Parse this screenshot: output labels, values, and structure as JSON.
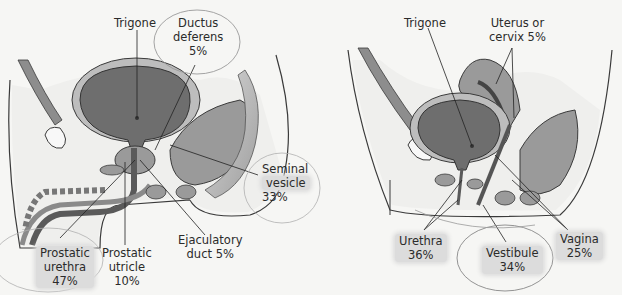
{
  "figure": {
    "male": {
      "panel": "male pelvis sagittal section",
      "labels": {
        "trigone": "Trigone",
        "ductus_deferens": [
          "Ductus",
          "deferens",
          "5%"
        ],
        "seminal_vesicle": [
          "Seminal",
          "vesicle",
          "33%"
        ],
        "ejaculatory_duct": [
          "Ejaculatory",
          "duct 5%"
        ],
        "prostatic_urethra": [
          "Prostatic",
          "urethra",
          "47%"
        ],
        "prostatic_utricle": [
          "Prostatic",
          "utricle",
          "10%"
        ]
      }
    },
    "female": {
      "panel": "female pelvis sagittal section",
      "labels": {
        "trigone": "Trigone",
        "uterus_cervix": [
          "Uterus or",
          "cervix 5%"
        ],
        "urethra": [
          "Urethra",
          "36%"
        ],
        "vestibule": [
          "Vestibule",
          "34%"
        ],
        "vagina": [
          "Vagina",
          "25%"
        ]
      }
    },
    "colors": {
      "background": "#f6f6f4",
      "organ_dark": "#6e6e6e",
      "organ_mid": "#9a9a9a",
      "organ_light": "#c4c4c4",
      "outline": "#3a3a3a",
      "highlight": "#dcdcdc",
      "annotation_circle": "#8a8a8a"
    }
  }
}
